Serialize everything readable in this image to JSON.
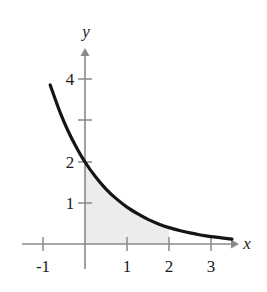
{
  "figure": {
    "title": "",
    "background_color": "#ffffff"
  },
  "axes": {
    "x_axis_label": "x",
    "y_axis_label": "y",
    "axis_color": "#8a8a8a",
    "x_ticks": [
      {
        "label": "-1",
        "value": -1
      },
      {
        "label": "1",
        "value": 1
      },
      {
        "label": "2",
        "value": 2
      },
      {
        "label": "3",
        "value": 3
      }
    ],
    "y_ticks": [
      {
        "label": "1",
        "value": 1
      },
      {
        "label": "2",
        "value": 2
      },
      {
        "label": "",
        "value": 3
      },
      {
        "label": "4",
        "value": 4
      }
    ]
  },
  "chart_data": {
    "type": "line",
    "title": "",
    "xlabel": "x",
    "ylabel": "y",
    "xlim": [
      -1.3,
      3.6
    ],
    "ylim": [
      -0.35,
      5.0
    ],
    "grid": false,
    "legend": false,
    "curve_color": "#141414",
    "shade_color": "#ececec",
    "series": [
      {
        "name": "y = 2e^(-0.8x)",
        "x": [
          -0.83,
          -0.6,
          -0.4,
          -0.2,
          0.0,
          0.25,
          0.5,
          0.75,
          1.0,
          1.25,
          1.5,
          1.75,
          2.0,
          2.25,
          2.5,
          2.75,
          3.0,
          3.25,
          3.5
        ],
        "y": [
          3.88,
          3.23,
          2.75,
          2.35,
          2.0,
          1.64,
          1.34,
          1.1,
          0.9,
          0.74,
          0.6,
          0.49,
          0.4,
          0.33,
          0.27,
          0.22,
          0.18,
          0.15,
          0.12
        ]
      }
    ],
    "shaded_region": {
      "description": "area under curve between x = 0 and x = 2",
      "x_start": 0,
      "x_end": 2
    }
  }
}
